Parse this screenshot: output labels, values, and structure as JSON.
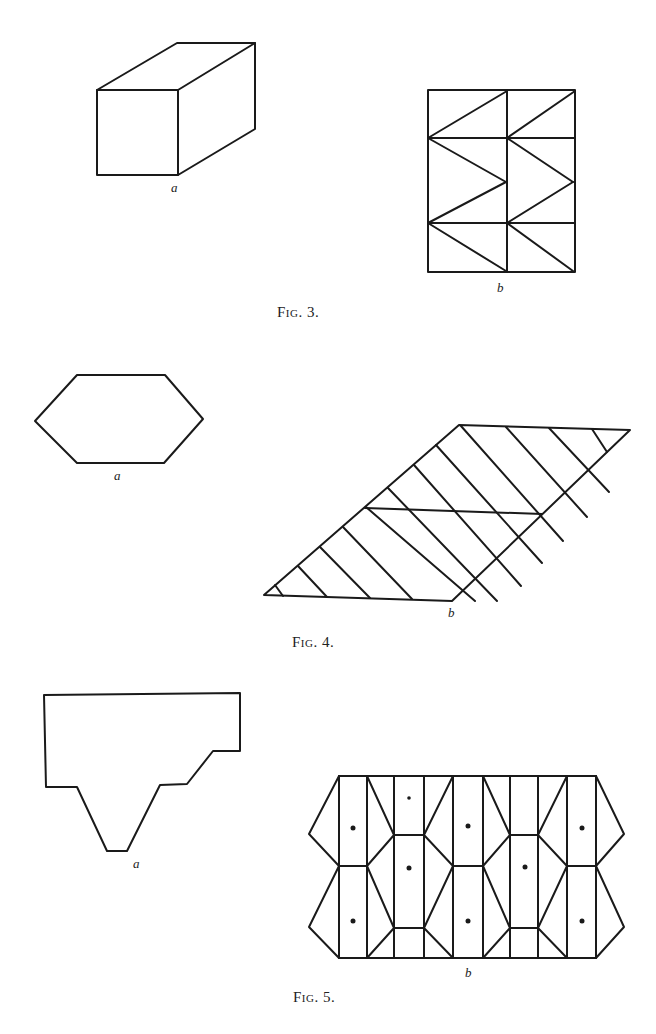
{
  "figures": [
    {
      "caption": "Fig. 3.",
      "parts": [
        {
          "label": "a",
          "description": "rectangular box (cuboid) in oblique projection"
        },
        {
          "label": "b",
          "description": "net of the box divided into triangles: 2 columns × 3 rows with zig-zag diagonals"
        }
      ]
    },
    {
      "caption": "Fig. 4.",
      "parts": [
        {
          "label": "a",
          "description": "hexagon"
        },
        {
          "label": "b",
          "description": "parallelogram with parallel diagonal hatching and one crossing line"
        }
      ]
    },
    {
      "caption": "Fig. 5.",
      "parts": [
        {
          "label": "a",
          "description": "stepped polygon with trapezoidal lower protrusion"
        },
        {
          "label": "b",
          "description": "tessellated strip of rectangles and trapezoids with dots marking cell centers"
        }
      ]
    }
  ],
  "labels": {
    "fig3a": "a",
    "fig3b": "b",
    "fig4a": "a",
    "fig4b": "b",
    "fig5a": "a",
    "fig5b": "b"
  },
  "captions": {
    "fig3": "Fig. 3.",
    "fig4": "Fig. 4.",
    "fig5": "Fig. 5."
  }
}
